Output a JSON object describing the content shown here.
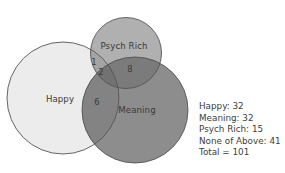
{
  "diagram": {
    "type": "venn",
    "sets": [
      {
        "name": "Happy",
        "label": "Happy",
        "total": 32,
        "color": "#ececec",
        "cx": 63,
        "cy": 98,
        "r": 56
      },
      {
        "name": "Meaning",
        "label": "Meaning",
        "total": 32,
        "color": "#8c8c8c",
        "cx": 135,
        "cy": 110,
        "r": 53
      },
      {
        "name": "Psych Rich",
        "label": "Psych Rich",
        "total": 15,
        "color": "#adadad",
        "cx": 126,
        "cy": 53,
        "r": 35.5
      }
    ],
    "regions": [
      {
        "sets": [
          "Happy",
          "Psych Rich"
        ],
        "value": "1"
      },
      {
        "sets": [
          "Happy",
          "Psych Rich",
          "Meaning"
        ],
        "value": "2"
      },
      {
        "sets": [
          "Psych Rich",
          "Meaning"
        ],
        "value": "8"
      },
      {
        "sets": [
          "Happy",
          "Meaning"
        ],
        "value": "6"
      }
    ]
  },
  "labels": {
    "happy": "Happy",
    "meaning": "Meaning",
    "psych_rich": "Psych Rich",
    "region_hp": "1",
    "region_hpm": "2",
    "region_pm": "8",
    "region_hm": "6"
  },
  "legend": {
    "lines": [
      "Happy: 32",
      "Meaning: 32",
      "Psych Rich: 15",
      "None of Above: 41",
      "Total = 101"
    ]
  }
}
